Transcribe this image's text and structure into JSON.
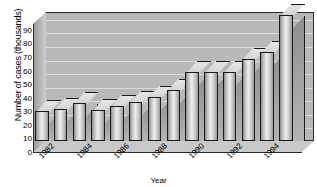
{
  "chart_data": {
    "type": "bar",
    "title": "",
    "xlabel": "Year",
    "ylabel": "Number of cases (thousands)",
    "ylim": [
      0,
      95
    ],
    "yticks": [
      0,
      10,
      20,
      30,
      40,
      50,
      60,
      70,
      80,
      90
    ],
    "ytick_labels": [
      "0",
      "10",
      "20",
      "30",
      "40",
      "50",
      "60",
      "70",
      "80",
      "90"
    ],
    "grid": true,
    "legend": "none",
    "three_d": true,
    "categories": [
      "1982",
      "",
      "1984",
      "",
      "1986",
      "",
      "1988",
      "",
      "1990",
      "",
      "1992",
      "",
      "1994",
      ""
    ],
    "xtick_labels": [
      {
        "text": "1982",
        "index": 0
      },
      {
        "text": "1984",
        "index": 2
      },
      {
        "text": "1986",
        "index": 4
      },
      {
        "text": "1988",
        "index": 6
      },
      {
        "text": "1990",
        "index": 8
      },
      {
        "text": "1992",
        "index": 10
      },
      {
        "text": "1994",
        "index": 12
      }
    ],
    "values": [
      21,
      23,
      27,
      22,
      25,
      28,
      32,
      37,
      50,
      50,
      50,
      60,
      65,
      92
    ],
    "bar_color": "#c8c8c8",
    "background_color": "#b9b9b9",
    "axis_color": "#1a1a1a"
  }
}
